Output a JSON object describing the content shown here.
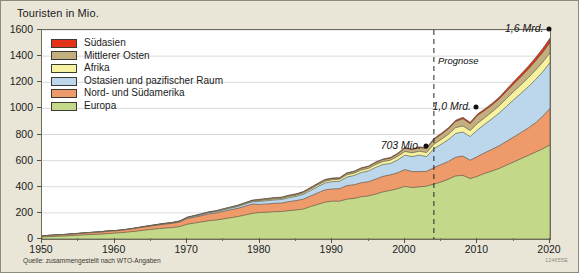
{
  "figure": {
    "title": "Touristen in Mio.",
    "source": "Quelle: zusammengestellt nach WTO-Angaben",
    "code": "124655E"
  },
  "legend": {
    "items": [
      {
        "label": "Südasien",
        "color": "#e3341a"
      },
      {
        "label": "Mittlerer Osten",
        "color": "#c2ae7e"
      },
      {
        "label": "Afrika",
        "color": "#f7f2a0"
      },
      {
        "label": "Ostasien und pazifischer Raum",
        "color": "#bcd7ec"
      },
      {
        "label": "Nord- und Südamerika",
        "color": "#ef9a6a"
      },
      {
        "label": "Europa",
        "color": "#c4d88a"
      }
    ]
  },
  "annotations": [
    {
      "name": "value-703-mio",
      "text": "703 Mio.",
      "x": 2003,
      "y": 703
    },
    {
      "name": "value-1-mrd",
      "text": "1,0 Mrd.",
      "x": 2010,
      "y": 1000
    },
    {
      "name": "value-1-6-mrd",
      "text": "1,6 Mrd.",
      "x": 2020,
      "y": 1600
    },
    {
      "name": "forecast-label",
      "text": "Prognose",
      "x": 2004
    }
  ],
  "forecast_line": {
    "label": "Prognose",
    "year": 2004
  },
  "chart_data": {
    "type": "area",
    "title": "Touristen in Mio.",
    "xlabel": "",
    "ylabel": "Touristen in Mio.",
    "xlim": [
      1950,
      2020
    ],
    "ylim": [
      0,
      1600
    ],
    "xticks": [
      1950,
      1960,
      1970,
      1980,
      1990,
      2000,
      2010,
      2020
    ],
    "yticks": [
      0,
      200,
      400,
      600,
      800,
      1000,
      1200,
      1400,
      1600
    ],
    "minor_xtick_interval": 5,
    "grid": true,
    "stacked": true,
    "legend_position": "upper-left-inside",
    "forecast_start_year": 2004,
    "x": [
      1950,
      1951,
      1952,
      1953,
      1954,
      1955,
      1956,
      1957,
      1958,
      1959,
      1960,
      1961,
      1962,
      1963,
      1964,
      1965,
      1966,
      1967,
      1968,
      1969,
      1970,
      1971,
      1972,
      1973,
      1974,
      1975,
      1976,
      1977,
      1978,
      1979,
      1980,
      1981,
      1982,
      1983,
      1984,
      1985,
      1986,
      1987,
      1988,
      1989,
      1990,
      1991,
      1992,
      1993,
      1994,
      1995,
      1996,
      1997,
      1998,
      1999,
      2000,
      2001,
      2002,
      2003,
      2004,
      2005,
      2006,
      2007,
      2008,
      2009,
      2010,
      2011,
      2012,
      2013,
      2014,
      2015,
      2016,
      2017,
      2018,
      2019,
      2020
    ],
    "series": [
      {
        "name": "Europa",
        "color": "#c4d88a",
        "values": [
          17,
          19,
          21,
          23,
          26,
          29,
          32,
          35,
          37,
          41,
          45,
          49,
          54,
          60,
          67,
          73,
          79,
          84,
          88,
          95,
          113,
          122,
          131,
          140,
          145,
          154,
          163,
          172,
          184,
          196,
          203,
          205,
          209,
          210,
          217,
          222,
          229,
          248,
          265,
          282,
          290,
          289,
          305,
          311,
          324,
          330,
          344,
          361,
          372,
          385,
          403,
          394,
          399,
          405,
          420,
          436,
          458,
          483,
          487,
          462,
          480,
          502,
          520,
          540,
          565,
          590,
          615,
          640,
          665,
          690,
          720
        ]
      },
      {
        "name": "Nord- und Südamerika",
        "color": "#ef9a6a",
        "values": [
          7,
          8,
          9,
          10,
          11,
          12,
          13,
          14,
          15,
          17,
          17,
          18,
          20,
          22,
          24,
          26,
          28,
          30,
          32,
          35,
          43,
          45,
          48,
          52,
          54,
          58,
          61,
          63,
          67,
          71,
          62,
          63,
          64,
          65,
          69,
          72,
          76,
          81,
          88,
          94,
          93,
          96,
          104,
          104,
          107,
          109,
          115,
          119,
          119,
          122,
          128,
          122,
          117,
          113,
          126,
          134,
          136,
          143,
          148,
          141,
          151,
          158,
          166,
          174,
          182,
          191,
          200,
          210,
          225,
          250,
          280
        ]
      },
      {
        "name": "Ostasien und pazifischer Raum",
        "color": "#bcd7ec",
        "values": [
          0.2,
          0.3,
          0.4,
          0.5,
          0.6,
          0.8,
          1,
          1.2,
          1.4,
          1.6,
          0.8,
          1,
          1.2,
          1.5,
          1.8,
          2.1,
          2.5,
          2.9,
          3.3,
          3.8,
          6,
          7,
          8,
          9,
          10,
          11,
          12,
          14,
          16,
          18,
          23,
          25,
          26,
          27,
          30,
          32,
          37,
          42,
          48,
          53,
          56,
          57,
          65,
          71,
          78,
          82,
          90,
          90,
          87,
          98,
          111,
          115,
          126,
          113,
          145,
          155,
          167,
          182,
          184,
          181,
          204,
          218,
          234,
          250,
          268,
          285,
          300,
          315,
          330,
          340,
          350
        ]
      },
      {
        "name": "Afrika",
        "color": "#f7f2a0",
        "values": [
          0.5,
          0.6,
          0.7,
          0.8,
          0.9,
          1,
          1.1,
          1.2,
          1.3,
          1.4,
          0.8,
          0.9,
          1,
          1.2,
          1.4,
          1.6,
          1.8,
          2,
          2.2,
          2.5,
          2.4,
          2.7,
          3,
          3.4,
          3.6,
          4,
          4.4,
          4.8,
          5.2,
          5.7,
          7,
          8,
          8,
          8,
          9,
          9,
          10,
          11,
          13,
          14,
          15,
          16,
          18,
          18,
          19,
          20,
          22,
          23,
          25,
          27,
          28,
          29,
          30,
          31,
          34,
          37,
          41,
          45,
          46,
          46,
          50,
          50,
          53,
          56,
          60,
          63,
          66,
          69,
          72,
          74,
          75
        ]
      },
      {
        "name": "Mittlerer Osten",
        "color": "#c2ae7e",
        "values": [
          0.2,
          0.2,
          0.3,
          0.3,
          0.4,
          0.4,
          0.5,
          0.5,
          0.6,
          0.7,
          0.6,
          0.7,
          0.8,
          0.9,
          1,
          1.1,
          1.3,
          1.4,
          1.6,
          1.8,
          1.9,
          2.1,
          2.4,
          2.7,
          3,
          3.3,
          3.7,
          4,
          4.4,
          4.8,
          7,
          7,
          8,
          8,
          8,
          8,
          8,
          9,
          9,
          10,
          10,
          8,
          11,
          12,
          13,
          14,
          15,
          15,
          16,
          18,
          25,
          24,
          28,
          30,
          36,
          38,
          41,
          47,
          56,
          53,
          60,
          56,
          52,
          52,
          55,
          58,
          62,
          66,
          70,
          75,
          80
        ]
      },
      {
        "name": "Südasien",
        "color": "#e3341a",
        "values": [
          0.1,
          0.1,
          0.1,
          0.1,
          0.2,
          0.2,
          0.2,
          0.2,
          0.3,
          0.3,
          0.2,
          0.2,
          0.3,
          0.3,
          0.4,
          0.4,
          0.5,
          0.5,
          0.6,
          0.7,
          0.9,
          1,
          1.1,
          1.2,
          1.3,
          1.5,
          1.6,
          1.8,
          2,
          2.2,
          2,
          2.1,
          2.2,
          2.3,
          2.5,
          2.6,
          2.8,
          3,
          3.2,
          3.4,
          3.2,
          3.2,
          3.6,
          3.5,
          3.8,
          4.2,
          4.4,
          4.8,
          5.1,
          5.8,
          6.1,
          5.8,
          5.8,
          6.4,
          7.6,
          8.1,
          8.8,
          9.8,
          10.2,
          9.9,
          11,
          12,
          13,
          14,
          16,
          18,
          20,
          23,
          26,
          29,
          33
        ]
      }
    ]
  }
}
